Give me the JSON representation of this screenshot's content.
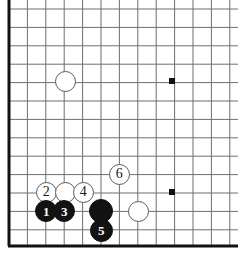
{
  "figure": {
    "kind": "go-board-diagram",
    "region": "bottom-left corner",
    "width": 238,
    "height": 256,
    "colors": {
      "background": "#ffffff",
      "grid_line": "#6e6e6e",
      "border_line": "#111111",
      "black_stone": "#121212",
      "white_stone_fill": "#ffffff",
      "white_stone_edge": "#5a5a5a",
      "star_point": "#111111",
      "black_label": "#ffffff",
      "white_label": "#1a1a1a"
    }
  },
  "grid": {
    "cell": 18.4,
    "origin_x": 9,
    "origin_y": 9,
    "columns": 13,
    "rows": 14,
    "border_left_x": 9,
    "border_bottom_y": 246,
    "border_thickness": 3,
    "line_thickness": 1,
    "has_left_border": true,
    "has_bottom_border": true,
    "has_top_border": false,
    "has_right_border": false
  },
  "star_points": [
    {
      "name": "star-point-upper",
      "x": 172,
      "y": 81,
      "size": 6
    },
    {
      "name": "star-point-lower",
      "x": 172,
      "y": 192,
      "size": 6
    }
  ],
  "stones": [
    {
      "name": "white-stone-corner-4-4",
      "color": "white",
      "label": "",
      "x": 65,
      "y": 81,
      "d": 21,
      "z": 1
    },
    {
      "name": "white-stone-move-2",
      "color": "white",
      "label": "2",
      "x": 46,
      "y": 192,
      "d": 21,
      "z": 2
    },
    {
      "name": "white-stone-unnumbered-upper",
      "color": "white",
      "label": "",
      "x": 65,
      "y": 192,
      "d": 21,
      "z": 3
    },
    {
      "name": "white-stone-move-4",
      "color": "white",
      "label": "4",
      "x": 83,
      "y": 192,
      "d": 21,
      "z": 4
    },
    {
      "name": "white-stone-move-6",
      "color": "white",
      "label": "6",
      "x": 119,
      "y": 174,
      "d": 21,
      "z": 5
    },
    {
      "name": "white-stone-unnumbered-right",
      "color": "white",
      "label": "",
      "x": 138,
      "y": 211,
      "d": 21,
      "z": 6
    },
    {
      "name": "black-stone-move-1",
      "color": "black",
      "label": "1",
      "x": 46,
      "y": 211,
      "d": 22,
      "z": 7
    },
    {
      "name": "black-stone-move-3",
      "color": "black",
      "label": "3",
      "x": 64,
      "y": 211,
      "d": 22,
      "z": 8
    },
    {
      "name": "black-stone-unnumbered",
      "color": "black",
      "label": "",
      "x": 101,
      "y": 211,
      "d": 24,
      "z": 9
    },
    {
      "name": "black-stone-move-5",
      "color": "black",
      "label": "5",
      "x": 101,
      "y": 230,
      "d": 23,
      "z": 10
    }
  ],
  "move_sequence": [
    "1",
    "2",
    "3",
    "4",
    "5",
    "6"
  ]
}
